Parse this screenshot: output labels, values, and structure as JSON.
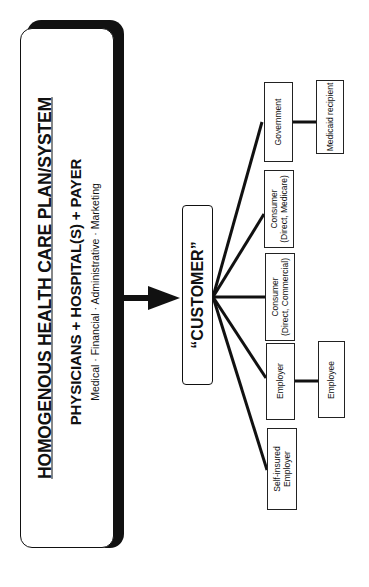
{
  "plan": {
    "title": "HOMOGENOUS HEALTH CARE PLAN/SYSTEM",
    "components": "PHYSICIANS + HOSPITAL(S) + PAYER",
    "functions": "Medical · Financial · Administrative · Marketing"
  },
  "customer": {
    "label": "“CUSTOMER”"
  },
  "segments": [
    {
      "id": "government",
      "line1": "Government",
      "line2": ""
    },
    {
      "id": "consumer-medicare",
      "line1": "Consumer",
      "line2": "(Direct, Medicare)"
    },
    {
      "id": "consumer-commercial",
      "line1": "Consumer",
      "line2": "(Direct, Commercial)"
    },
    {
      "id": "employer",
      "line1": "Employer",
      "line2": ""
    },
    {
      "id": "self-insured-employer",
      "line1": "Self-insured",
      "line2": "Employer"
    }
  ],
  "sub_segments": [
    {
      "parent": "government",
      "label": "Medicaid recipient"
    },
    {
      "parent": "employer",
      "label": "Employee"
    }
  ],
  "orientation": "rotated -90deg (page printed landscape)"
}
